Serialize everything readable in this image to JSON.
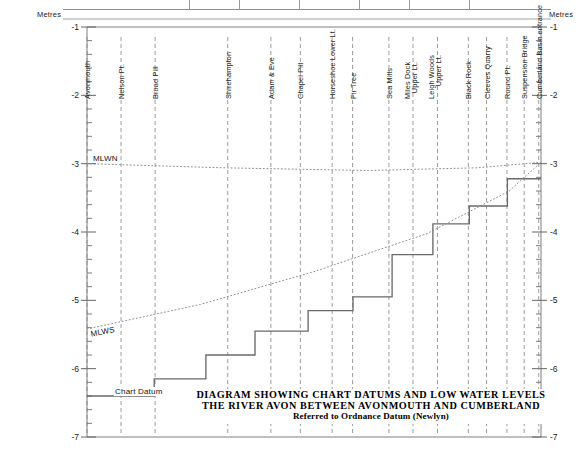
{
  "figure": {
    "title_line1": "DIAGRAM SHOWING CHART DATUMS AND LOW WATER LEVELS IN",
    "title_line2": "THE RIVER AVON BETWEEN AVONMOUTH AND CUMBERLAND BASIN",
    "title_line3": "Referred to Ordnance Datum (Newlyn)",
    "axis_label_left": "Metres",
    "axis_label_right": "Metres",
    "chart_datum_label": "Chart Datum",
    "mlwn_label": "MLWN",
    "mlws_label": "MLWS"
  },
  "chart_data": {
    "type": "line",
    "subtitle": "Referred to Ordnance Datum (Newlyn)",
    "xlabel": "",
    "ylabel": "Metres",
    "ylim": [
      -7,
      -1
    ],
    "yticks": [
      -1,
      -2,
      -3,
      -4,
      -5,
      -6,
      -7
    ],
    "ytick_labels": [
      "-1",
      "-2",
      "-3",
      "-4",
      "-5",
      "-6",
      "-7"
    ],
    "y_minor_step": 0.2,
    "grid": false,
    "legend": "none",
    "stations": [
      {
        "name": "Avonmouth",
        "x": 0.0
      },
      {
        "name": "Nelson Pt.",
        "x": 0.075
      },
      {
        "name": "Broad Pill",
        "x": 0.15
      },
      {
        "name": "Shirehampton",
        "x": 0.31
      },
      {
        "name": "Adam & Eve",
        "x": 0.405
      },
      {
        "name": "Chapel Pill",
        "x": 0.47
      },
      {
        "name": "Horseshoe Lower Lt.",
        "x": 0.54
      },
      {
        "name": "Fir Tree",
        "x": 0.585
      },
      {
        "name": "Sea Mills",
        "x": 0.665
      },
      {
        "name": "Miles Dock Upper Lt.",
        "x": 0.718
      },
      {
        "name": "Leigh Woods Upper Lt.",
        "x": 0.772
      },
      {
        "name": "Black Rock",
        "x": 0.84
      },
      {
        "name": "Cleeves Quarry",
        "x": 0.88
      },
      {
        "name": "Round Pt.",
        "x": 0.925
      },
      {
        "name": "Suspension Bridge",
        "x": 0.963
      },
      {
        "name": "Cumberland Basin entrance",
        "x": 0.995
      }
    ],
    "series": [
      {
        "name": "Chart Datum",
        "style": "step",
        "x": [
          0.0,
          0.148,
          0.148,
          0.262,
          0.262,
          0.37,
          0.37,
          0.487,
          0.487,
          0.586,
          0.586,
          0.672,
          0.672,
          0.762,
          0.762,
          0.842,
          0.842,
          0.926,
          0.926,
          1.0
        ],
        "values": [
          -6.4,
          -6.4,
          -6.15,
          -6.15,
          -5.8,
          -5.8,
          -5.45,
          -5.45,
          -5.15,
          -5.15,
          -4.95,
          -4.95,
          -4.33,
          -4.33,
          -3.88,
          -3.88,
          -3.62,
          -3.62,
          -3.22,
          -3.22
        ]
      },
      {
        "name": "MLWN",
        "style": "dotted",
        "x": [
          0.0,
          0.3,
          0.62,
          0.86,
          1.0
        ],
        "values": [
          -3.0,
          -3.06,
          -3.1,
          -3.06,
          -2.98
        ]
      },
      {
        "name": "MLWS",
        "style": "dotted",
        "x": [
          0.0,
          0.25,
          0.5,
          0.75,
          0.93,
          1.0
        ],
        "values": [
          -5.42,
          -5.06,
          -4.58,
          -4.02,
          -3.4,
          -2.98
        ]
      }
    ]
  }
}
